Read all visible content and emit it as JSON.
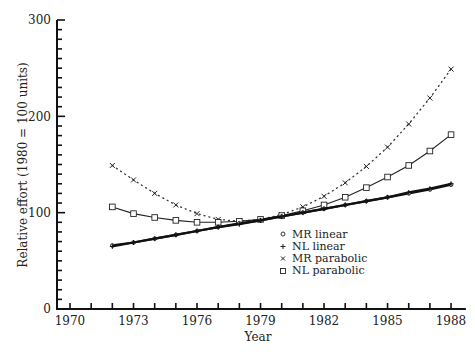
{
  "chart_data": {
    "type": "line",
    "title": "",
    "xlabel": "Year",
    "ylabel": "Relative effort (1980 = 100 units)",
    "xlim": [
      1969.7,
      1988.5
    ],
    "ylim": [
      0,
      300
    ],
    "x_ticks": [
      1970,
      1973,
      1976,
      1979,
      1982,
      1985,
      1988
    ],
    "x_minor_step": 1,
    "y_ticks": [
      0,
      100,
      200,
      300
    ],
    "y_minor_step": 10,
    "grid": false,
    "legend_position": "lower-right-inside",
    "x": [
      1972,
      1973,
      1974,
      1975,
      1976,
      1977,
      1978,
      1979,
      1980,
      1981,
      1982,
      1983,
      1984,
      1985,
      1986,
      1987,
      1988
    ],
    "series": [
      {
        "name": "MR linear",
        "marker": "circle",
        "line": "solid-thick",
        "values": [
          66,
          69,
          73,
          77,
          81,
          85,
          89,
          92,
          96,
          100,
          104,
          108,
          112,
          116,
          120,
          124,
          129
        ]
      },
      {
        "name": "NL linear",
        "marker": "plus",
        "line": "solid-thick",
        "values": [
          65,
          69,
          73,
          77,
          81,
          85,
          88,
          92,
          96,
          100,
          104,
          108,
          112,
          116,
          121,
          125,
          130
        ]
      },
      {
        "name": "MR parabolic",
        "marker": "x",
        "line": "dotted",
        "values": [
          149,
          134,
          120,
          108,
          99,
          93,
          91,
          93,
          98,
          106,
          117,
          131,
          148,
          168,
          192,
          219,
          249
        ]
      },
      {
        "name": "NL parabolic",
        "marker": "square",
        "line": "solid-thin",
        "values": [
          106,
          99,
          95,
          92,
          90,
          90,
          91,
          93,
          97,
          102,
          108,
          116,
          126,
          137,
          149,
          164,
          181
        ]
      }
    ]
  },
  "legend": {
    "items": [
      {
        "label": "MR linear",
        "symbol": "o"
      },
      {
        "label": "NL linear",
        "symbol": "+"
      },
      {
        "label": "MR parabolic",
        "symbol": "×"
      },
      {
        "label": "NL parabolic",
        "symbol": "□"
      }
    ]
  },
  "axes": {
    "x_title": "Year",
    "y_title": "Relative effort (1980 = 100 units)",
    "x_tick_labels": [
      "1970",
      "1973",
      "1976",
      "1979",
      "1982",
      "1985",
      "1988"
    ],
    "y_tick_labels": [
      "0",
      "100",
      "200",
      "300"
    ]
  }
}
